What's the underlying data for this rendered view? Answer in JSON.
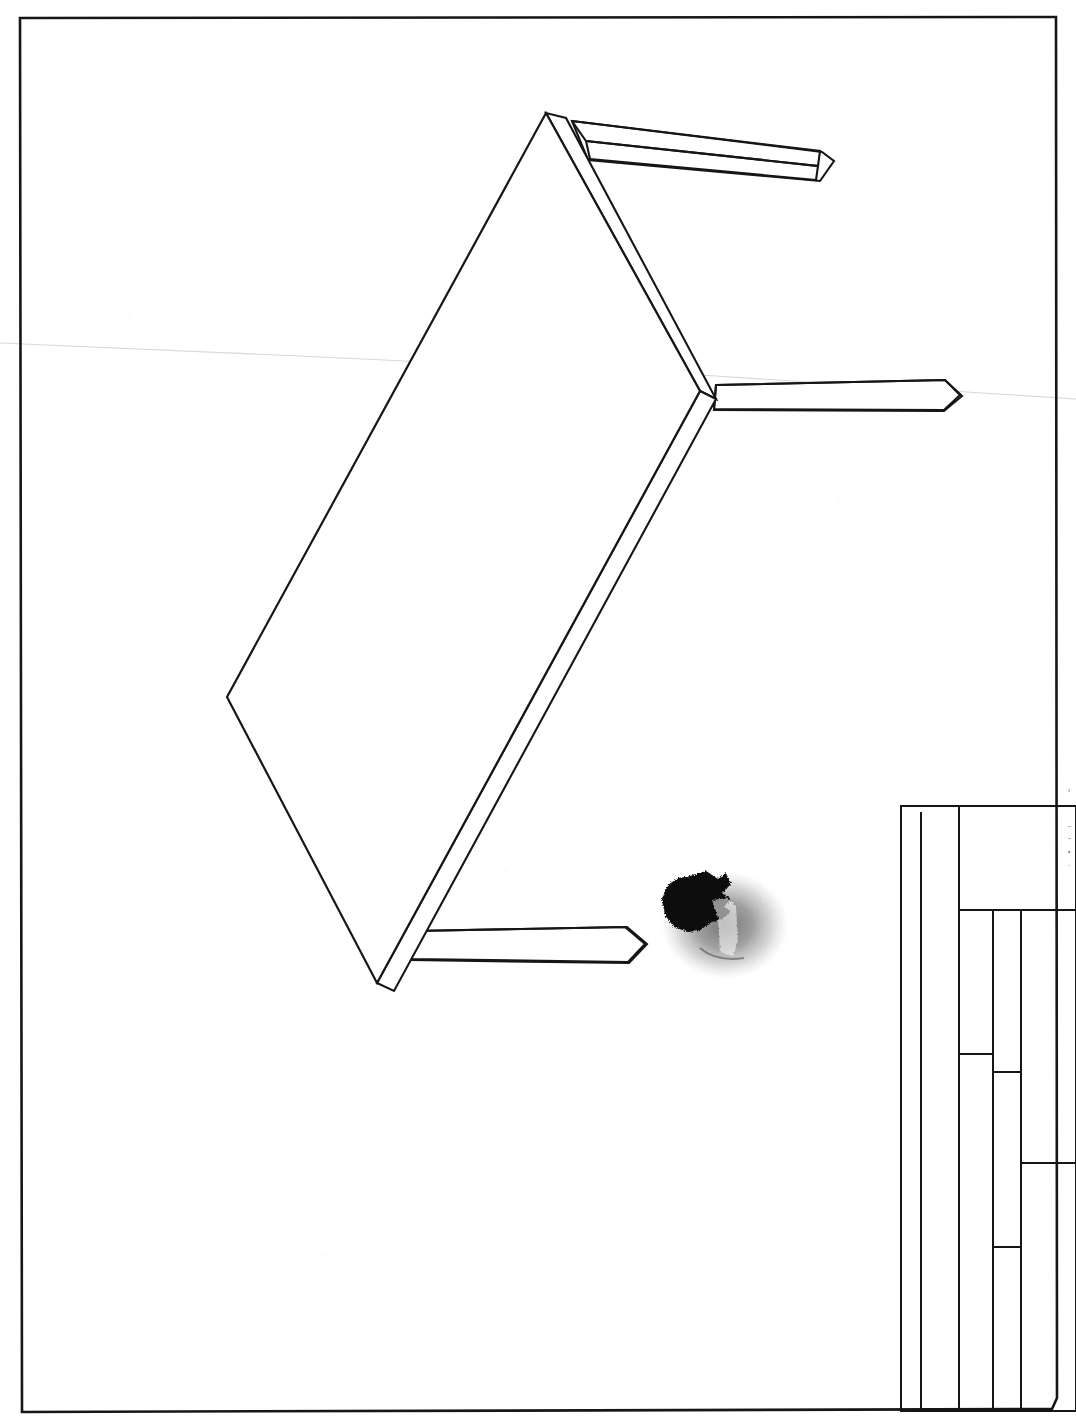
{
  "document": {
    "kind": "scanned-technical-drawing",
    "medium": "ink-on-paper",
    "view": "axonometric",
    "subject": "table",
    "sheet_width": 1076,
    "sheet_height": 1427,
    "background_color": "#ffffff",
    "ink_color": "#161616",
    "crease_color": "#d8d8d8",
    "blot_color": "#0a0a0a",
    "blot_halo_color": "#9a9a9a"
  },
  "sheet_border": {
    "name": "drawing-sheet-border",
    "points": "20,18 1056,17 1057,1398 1052,1409 22,1412 20,18",
    "stroke_width": 2.6
  },
  "crease": {
    "name": "paper-fold-crease",
    "points": "0,343 300,356 700,375 1076,399",
    "stroke_width": 1.1
  },
  "tabletop": {
    "name": "table-top-panel",
    "top_face": "546,113 700,391 377,983 227,697 546,113",
    "corners": [
      {
        "label": "top",
        "x": 546,
        "y": 113
      },
      {
        "label": "right",
        "x": 700,
        "y": 391
      },
      {
        "label": "bottom",
        "x": 377,
        "y": 983
      },
      {
        "label": "left",
        "x": 227,
        "y": 697
      }
    ],
    "front_edge_right": "546,113 700,391 716,399 566,118 546,113",
    "front_edge_bottom": "377,983 700,391 716,399 394,991 377,983",
    "stroke_width": 2.2
  },
  "legs": [
    {
      "name": "leg-rear-right",
      "top_face": "572,121 820,151 818,166 586,141 572,121",
      "side_face": "586,141 818,166 816,180 590,159 586,141",
      "end_cap": "820,151 833,161 818,180",
      "body": "572,121 822,152 834,161 820,181 588,160 572,121"
    },
    {
      "name": "leg-right",
      "top_face": "716,385 945,380 960,395 944,410 714,409 716,385",
      "body": "716,385 945,380 962,396 944,411 714,410 716,385"
    },
    {
      "name": "leg-front-left",
      "top_face": "412,931 625,927 645,944 628,962 412,959 412,931",
      "body": "412,931 627,927 647,944 629,963 410,960 412,931"
    }
  ],
  "ink_blot": {
    "name": "ink-blot-artifact",
    "center_x": 725,
    "center_y": 925,
    "halo_rx": 66,
    "halo_ry": 56,
    "core_path": "M 690 876 L 706 871 L 718 879 L 726 873 L 731 884 L 722 893 L 731 899 L 724 906 L 731 912 L 722 919 L 712 922 L 700 930 L 688 932 L 674 927 L 665 915 L 662 899 L 668 885 L 678 878 Z"
  },
  "title_block": {
    "name": "drawing-title-block",
    "origin_x": 901,
    "origin_y": 806,
    "width": 175,
    "height": 605,
    "outer_rect": {
      "x": 901,
      "y": 806,
      "w": 175,
      "h": 605
    },
    "inner_left_rule_x": 921,
    "vertical_rules": [
      {
        "name": "rule-col-1",
        "x": 959,
        "y1": 806,
        "y2": 1411
      },
      {
        "name": "rule-col-2",
        "x": 993,
        "y1": 910,
        "y2": 1411
      },
      {
        "name": "rule-col-3",
        "x": 1021,
        "y1": 910,
        "y2": 1411
      },
      {
        "name": "rule-col-left-inner",
        "x": 921,
        "y1": 812,
        "y2": 1409
      }
    ],
    "horizontal_rules": [
      {
        "name": "rule-row-header",
        "x1": 959,
        "x2": 1076,
        "y": 910
      },
      {
        "name": "rule-row-a",
        "x1": 959,
        "x2": 993,
        "y": 1054
      },
      {
        "name": "rule-row-b",
        "x1": 993,
        "x2": 1021,
        "y": 1072
      },
      {
        "name": "rule-row-c",
        "x1": 1021,
        "x2": 1076,
        "y": 1163
      },
      {
        "name": "rule-row-d",
        "x1": 993,
        "x2": 1021,
        "y": 1247
      },
      {
        "name": "rule-top",
        "x1": 901,
        "x2": 1076,
        "y": 806
      },
      {
        "name": "rule-bottom",
        "x1": 901,
        "x2": 1076,
        "y": 1411
      }
    ],
    "stroke_width": 2.0
  },
  "edge_marks": {
    "name": "cut-off-edge-text",
    "note": "illegible text fragments clipped at right sheet edge",
    "items": [
      {
        "x": 1068,
        "y": 787,
        "text": "‹"
      },
      {
        "x": 1068,
        "y": 822,
        "text": "–"
      },
      {
        "x": 1068,
        "y": 834,
        "text": "–"
      },
      {
        "x": 1068,
        "y": 848,
        "text": "•"
      },
      {
        "x": 1068,
        "y": 862,
        "text": "·"
      }
    ]
  }
}
